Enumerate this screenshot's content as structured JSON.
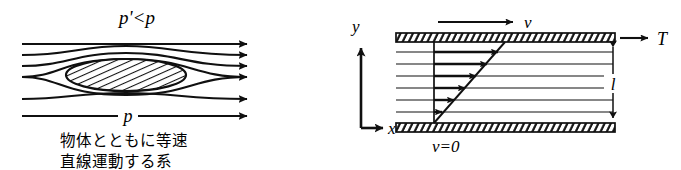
{
  "figure": {
    "background_color": "#ffffff",
    "ink_color": "#101010"
  },
  "left_panel": {
    "name": "streamlines-around-body",
    "top_label": "p'<p",
    "bottom_label": "p",
    "caption_line1": "物体とともに等速",
    "caption_line2": "直線運動する系",
    "streamline_count": 6,
    "arrowhead_count": 6,
    "body_shape": "hatched-ellipse",
    "body_hatch": "diagonal"
  },
  "right_panel": {
    "name": "couette-flow-between-plates",
    "axis_y_label": "y",
    "axis_x_label": "x",
    "top_velocity_label": "v",
    "shear_force_label": "T",
    "gap_label": "l",
    "bottom_velocity_label": "v=0",
    "fluid_line_count": 6,
    "profile_arrow_count": 6,
    "plate_hatch": "diagonal",
    "profile_type": "linear"
  }
}
